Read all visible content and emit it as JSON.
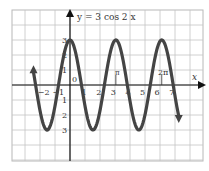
{
  "chart_data": {
    "type": "line",
    "title": "y = 3 cos 2 x",
    "xlabel": "x",
    "ylabel": "",
    "function": "y = 3*cos(2*x)",
    "xlim": [
      -4,
      9
    ],
    "ylim": [
      -5,
      5
    ],
    "x_visible_range": [
      -2.5,
      7.45
    ],
    "x_ticks": [
      "-2",
      "-1",
      "1",
      "2",
      "3",
      "4",
      "5",
      "6",
      "7"
    ],
    "y_ticks": [
      "3",
      "2",
      "1",
      "-1",
      "-2",
      "-3"
    ],
    "origin_label": "0",
    "annotations": [
      {
        "text": "π",
        "x": 3.14159
      },
      {
        "text": "2π",
        "x": 6.28318
      }
    ],
    "grid": true,
    "amplitude": 3,
    "period": 3.14159,
    "series": [
      {
        "name": "y = 3 cos 2x",
        "color": "#444444"
      }
    ],
    "x": [
      -2.5,
      -2.0,
      -1.5708,
      -1.0,
      -0.7854,
      0,
      0.7854,
      1.0,
      1.5708,
      2.0,
      2.3562,
      3.1416,
      3.927,
      4.7124,
      5.4978,
      6.2832,
      7.0,
      7.45
    ],
    "values": [
      0.85,
      -1.96,
      -3.0,
      -1.25,
      0,
      3.0,
      0,
      -1.25,
      -3.0,
      -1.96,
      0,
      3.0,
      0,
      -3.0,
      0,
      3.0,
      0.41,
      -2.1
    ]
  },
  "labels": {
    "title": "y = 3 cos 2 x",
    "x_axis": "x",
    "origin": "0",
    "pi": "π",
    "two_pi": "2π"
  }
}
